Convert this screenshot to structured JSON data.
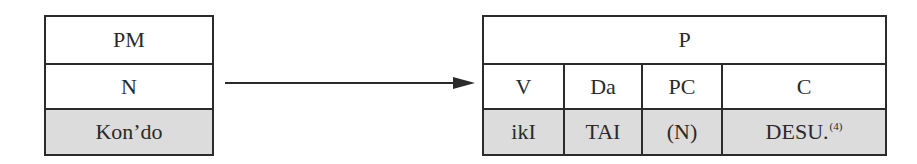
{
  "left_table": {
    "rows": [
      {
        "label": "PM",
        "shaded": false
      },
      {
        "label": "N",
        "shaded": false
      },
      {
        "label": "Kon’do",
        "shaded": true
      }
    ]
  },
  "arrow": {
    "direction": "right"
  },
  "right_table": {
    "header": "P",
    "categories": [
      {
        "label": "V"
      },
      {
        "label": "Da"
      },
      {
        "label": "PC"
      },
      {
        "label": "C"
      }
    ],
    "values": [
      {
        "label": "ikI"
      },
      {
        "label": "TAI"
      },
      {
        "label": "(N)"
      },
      {
        "label": "DESU.",
        "footnote": "(4)"
      }
    ]
  },
  "colors": {
    "border": "#2b2b2b",
    "shade": "#dcdcdc",
    "text": "#2a2a2a"
  }
}
